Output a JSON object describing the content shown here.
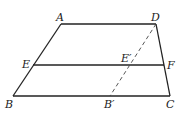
{
  "diagram": {
    "points": {
      "A": {
        "label": "A",
        "x": 61,
        "y": 24
      },
      "D": {
        "label": "D",
        "x": 156,
        "y": 24
      },
      "E": {
        "label": "E",
        "x": 33,
        "y": 65
      },
      "F": {
        "label": "F",
        "x": 163,
        "y": 65
      },
      "B": {
        "label": "B",
        "x": 13,
        "y": 96
      },
      "C": {
        "label": "C",
        "x": 170,
        "y": 96
      },
      "Bp": {
        "label": "B′",
        "x": 110,
        "y": 96
      },
      "Ep": {
        "label": "E′",
        "x": 130,
        "y": 65
      }
    },
    "segments": [
      {
        "from": "A",
        "to": "D",
        "style": "solid"
      },
      {
        "from": "A",
        "to": "B",
        "style": "solid"
      },
      {
        "from": "D",
        "to": "C",
        "style": "solid"
      },
      {
        "from": "B",
        "to": "C",
        "style": "solid"
      },
      {
        "from": "E",
        "to": "F",
        "style": "solid"
      },
      {
        "from": "D",
        "to": "B′",
        "style": "dashed"
      }
    ],
    "colors": {
      "stroke": "#222222"
    }
  }
}
